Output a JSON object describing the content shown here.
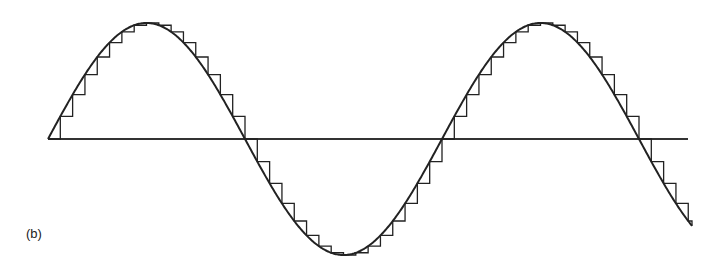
{
  "figure": {
    "label": "(b)"
  },
  "chart_data": {
    "type": "line",
    "title": "",
    "xlabel": "",
    "ylabel": "",
    "series": [
      {
        "name": "sine",
        "style": "smooth"
      },
      {
        "name": "staircase approximation",
        "style": "step",
        "steps_per_period": 32
      }
    ],
    "periods": 1.65,
    "amplitude": 1,
    "axis": {
      "zero_line": true
    },
    "geometry": {
      "x_start": 48,
      "x_axis_end": 688,
      "x_wave_end": 692,
      "y_zero": 139,
      "amplitude_px": 116,
      "period_px": 394
    },
    "colors": {
      "line": "#222222",
      "background": "#ffffff"
    }
  }
}
